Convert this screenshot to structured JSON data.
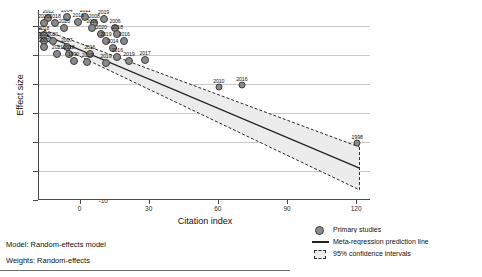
{
  "chart_data": {
    "type": "scatter",
    "title": "",
    "xlabel": "Citation index",
    "ylabel": "Effect size",
    "xlim": [
      -18,
      126
    ],
    "ylim": [
      -10,
      3.1
    ],
    "xticks": [
      0,
      30,
      60,
      90,
      120
    ],
    "yticks": [
      2,
      0,
      -2,
      -4,
      -6,
      -8,
      -10
    ],
    "grid": true,
    "legend_position": "bottom-right",
    "series": [
      {
        "name": "Primary studies",
        "marker": "circle",
        "color": "#8a8a8a",
        "points": [
          {
            "x": -14,
            "y": 2.55,
            "label": "2012",
            "size": 3
          },
          {
            "x": -6,
            "y": 2.62,
            "label": "2004",
            "size": 3
          },
          {
            "x": 2,
            "y": 2.6,
            "label": "2011",
            "size": 3
          },
          {
            "x": 10,
            "y": 2.5,
            "label": "2019",
            "size": 3
          },
          {
            "x": -16,
            "y": 2.22,
            "label": "2020",
            "size": 3
          },
          {
            "x": -11,
            "y": 2.22,
            "label": "2018",
            "size": 3
          },
          {
            "x": -1,
            "y": 2.28,
            "label": "2016",
            "size": 3
          },
          {
            "x": 6,
            "y": 2.2,
            "label": "2008",
            "size": 3
          },
          {
            "x": -7,
            "y": 1.88,
            "label": "2020",
            "size": 3
          },
          {
            "x": 5,
            "y": 1.85,
            "label": "2016",
            "size": 3
          },
          {
            "x": 15,
            "y": 1.85,
            "label": "2006",
            "size": 3
          },
          {
            "x": -16,
            "y": 1.4,
            "label": "2018",
            "size": 3
          },
          {
            "x": 9,
            "y": 1.42,
            "label": "2020",
            "size": 3
          },
          {
            "x": 16,
            "y": 1.42,
            "label": "2018",
            "size": 3
          },
          {
            "x": -16,
            "y": 0.98,
            "label": "2022",
            "size": 3
          },
          {
            "x": -12,
            "y": 0.98,
            "label": "2021",
            "size": 3
          },
          {
            "x": 11,
            "y": 0.98,
            "label": "2019",
            "size": 3
          },
          {
            "x": 19,
            "y": 0.98,
            "label": "2016",
            "size": 3
          },
          {
            "x": -16,
            "y": 0.52,
            "label": "2007",
            "size": 3
          },
          {
            "x": -6,
            "y": 0.52,
            "label": "2007",
            "size": 3
          },
          {
            "x": 14,
            "y": 0.5,
            "label": "2014",
            "size": 3
          },
          {
            "x": -10,
            "y": 0.06,
            "label": "2021",
            "size": 3
          },
          {
            "x": -5,
            "y": 0.06,
            "label": "2018",
            "size": 3
          },
          {
            "x": 4,
            "y": 0.06,
            "label": "2016",
            "size": 3
          },
          {
            "x": 16,
            "y": -0.12,
            "label": "2016",
            "size": 3
          },
          {
            "x": -3,
            "y": -0.42,
            "label": "1990",
            "size": 3
          },
          {
            "x": 3,
            "y": -0.48,
            "label": "2019",
            "size": 3
          },
          {
            "x": 11,
            "y": -0.52,
            "label": "2019",
            "size": 3
          },
          {
            "x": 21,
            "y": -0.42,
            "label": "2019",
            "size": 3
          },
          {
            "x": 28,
            "y": -0.38,
            "label": "2017",
            "size": 3
          },
          {
            "x": 60,
            "y": -2.22,
            "label": "2010",
            "size": 2.5
          },
          {
            "x": 70,
            "y": -2.08,
            "label": "2016",
            "size": 2.5
          },
          {
            "x": 120,
            "y": -6.1,
            "label": "1998",
            "size": 2.5
          }
        ]
      }
    ],
    "regression_line": {
      "name": "Meta-regression prediction line",
      "color": "#222222",
      "x_start": -18,
      "y_start": 1.55,
      "x_end": 121,
      "y_end": -7.8
    },
    "confidence_band": {
      "name": "95% confidence intervals",
      "level": "95%",
      "fill": "#ececec",
      "border": "#2a2a2a",
      "upper": [
        {
          "x": -18,
          "y": 1.85
        },
        {
          "x": 121,
          "y": -6.35
        }
      ],
      "lower": [
        {
          "x": -18,
          "y": 1.25
        },
        {
          "x": 121,
          "y": -9.3
        }
      ]
    }
  },
  "legend": {
    "items": [
      {
        "key": "marker",
        "label": "Primary studies"
      },
      {
        "key": "line",
        "label": "Meta-regression prediction line"
      },
      {
        "key": "band",
        "label": "95% confidence intervals"
      }
    ]
  },
  "notes": {
    "model": "Model: Random-effects model",
    "weights": "Weights: Random-effects"
  }
}
